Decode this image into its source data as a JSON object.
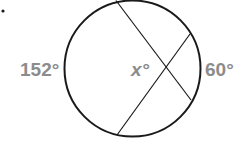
{
  "diagram": {
    "type": "circle-intersecting-chords",
    "bullet": "•",
    "labels": {
      "left_arc": "152°",
      "angle": "x°",
      "right_arc": "60°"
    },
    "colors": {
      "stroke": "#1a1a1a",
      "label": "#8c8c8c",
      "background": "#ffffff"
    },
    "circle": {
      "cx": 132.5,
      "cy": 68.5,
      "r": 68
    },
    "chords": [
      {
        "x1": 116,
        "y1": 0.5,
        "x2": 191,
        "y2": 100
      },
      {
        "x1": 117,
        "y1": 135,
        "x2": 190,
        "y2": 34
      }
    ]
  }
}
